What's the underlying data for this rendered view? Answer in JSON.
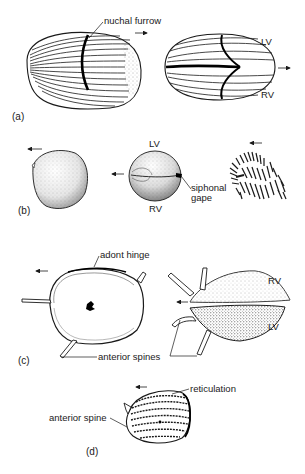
{
  "figure": {
    "panels": [
      {
        "id": "a",
        "label": "(a)",
        "annotations": {
          "nuchal_furrow": "nuchal furrow",
          "left_valve": "LV",
          "right_valve": "RV"
        },
        "arrows": [
          "right",
          "right"
        ]
      },
      {
        "id": "b",
        "label": "(b)",
        "annotations": {
          "left_valve": "LV",
          "right_valve": "RV",
          "siphonal_gape_line1": "siphonal",
          "siphonal_gape_line2": "gape"
        },
        "arrows": [
          "left",
          "left",
          "left"
        ]
      },
      {
        "id": "c",
        "label": "(c)",
        "annotations": {
          "adont_hinge": "adont hinge",
          "anterior_spines": "anterior spines",
          "right_valve": "RV",
          "left_valve": "LV"
        },
        "arrows": [
          "left",
          "left"
        ]
      },
      {
        "id": "d",
        "label": "(d)",
        "annotations": {
          "reticulation": "reticulation",
          "anterior_spine": "anterior spine"
        },
        "arrows": [
          "left"
        ]
      }
    ],
    "colors": {
      "ink": "#1a1a1a",
      "background": "#ffffff"
    }
  }
}
